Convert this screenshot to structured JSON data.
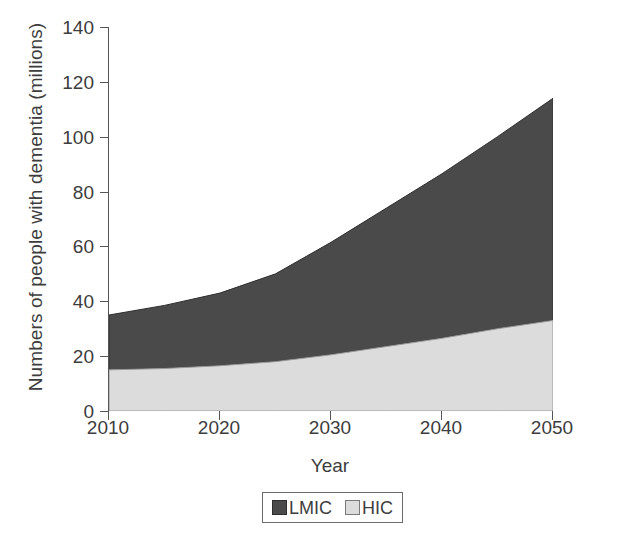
{
  "chart_data": {
    "type": "area",
    "stacked": true,
    "title": "",
    "xlabel": "Year",
    "ylabel": "Numbers of people with dementia (millions)",
    "x": [
      2010,
      2015,
      2020,
      2025,
      2030,
      2035,
      2040,
      2045,
      2050
    ],
    "xlim": [
      2010,
      2050
    ],
    "ylim": [
      0,
      140
    ],
    "xticks": [
      2010,
      2020,
      2030,
      2040,
      2050
    ],
    "yticks": [
      0,
      20,
      40,
      60,
      80,
      100,
      120,
      140
    ],
    "xtick_labels": [
      "2010",
      "2020",
      "2030",
      "2040",
      "2050"
    ],
    "ytick_labels": [
      "0",
      "20",
      "40",
      "60",
      "80",
      "100",
      "120",
      "140"
    ],
    "grid": false,
    "legend_position": "bottom",
    "series": [
      {
        "name": "HIC",
        "color": "#dcdcdc",
        "values": [
          15,
          15.5,
          16.5,
          18,
          20.5,
          23.5,
          26.5,
          30,
          33
        ]
      },
      {
        "name": "LMIC",
        "color": "#4a4a4a",
        "values": [
          20,
          23,
          26.5,
          32,
          41,
          50.5,
          60,
          70,
          81
        ]
      }
    ],
    "totals": [
      35,
      38.5,
      43,
      50,
      61.5,
      74,
      86.5,
      100,
      114
    ],
    "legend": [
      {
        "label": "LMIC",
        "swatch": "#4a4a4a",
        "border": "#2e2e2e"
      },
      {
        "label": "HIC",
        "swatch": "#dcdcdc",
        "border": "#7a7a7a"
      }
    ]
  },
  "axis": {
    "y_title": "Numbers of people with dementia (millions)",
    "x_title": "Year"
  }
}
